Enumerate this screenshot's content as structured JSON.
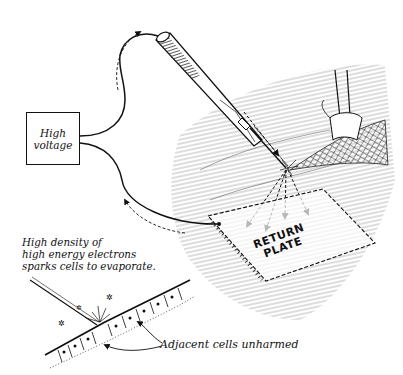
{
  "figure": {
    "power_box": {
      "line1": "High",
      "line2": "voltage"
    },
    "return_plate": {
      "line1": "RETURN",
      "line2": "PLATE"
    },
    "inset_caption": {
      "line1": "High density of",
      "line2": "high energy electrons",
      "line3": "sparks cells to evaporate."
    },
    "inset_pointer_label": "Adjacent cells unharmed",
    "colors": {
      "ink": "#111111",
      "background": "#ffffff",
      "hatch": "#555555"
    }
  }
}
